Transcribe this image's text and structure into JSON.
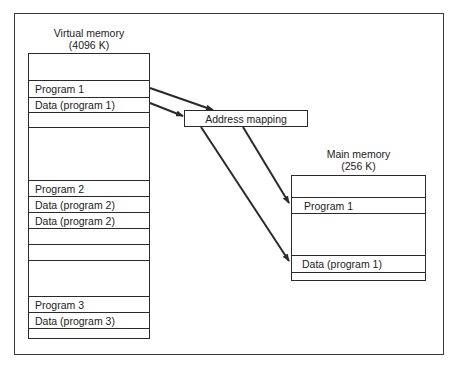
{
  "virtual_memory": {
    "title": "Virtual memory",
    "size": "(4096 K)",
    "rows": [
      {
        "label": "",
        "top": 0,
        "height": 26
      },
      {
        "label": "Program 1",
        "top": 26,
        "height": 17
      },
      {
        "label": "Data (program 1)",
        "top": 43,
        "height": 15
      },
      {
        "label": "",
        "top": 58,
        "height": 15
      },
      {
        "label": "",
        "top": 73,
        "height": 53
      },
      {
        "label": "Program 2",
        "top": 126,
        "height": 16
      },
      {
        "label": "Data (program 2)",
        "top": 142,
        "height": 16
      },
      {
        "label": "Data (program 2)",
        "top": 158,
        "height": 16
      },
      {
        "label": "",
        "top": 174,
        "height": 16
      },
      {
        "label": "",
        "top": 190,
        "height": 16
      },
      {
        "label": "",
        "top": 206,
        "height": 36
      },
      {
        "label": "Program 3",
        "top": 242,
        "height": 16
      },
      {
        "label": "Data (program 3)",
        "top": 258,
        "height": 16
      },
      {
        "label": "",
        "top": 274,
        "height": 11
      }
    ]
  },
  "address_mapping": {
    "label": "Address mapping"
  },
  "main_memory": {
    "title": "Main memory",
    "size": "(256 K)",
    "rows": [
      {
        "label": "",
        "top": 0,
        "height": 21
      },
      {
        "label": "Program 1",
        "top": 21,
        "height": 16
      },
      {
        "label": "",
        "top": 37,
        "height": 42
      },
      {
        "label": "Data (program 1)",
        "top": 79,
        "height": 17
      },
      {
        "label": "",
        "top": 96,
        "height": 9
      }
    ]
  },
  "arrows": [
    {
      "from": "virtual_memory.Program 1",
      "to": "address_mapping"
    },
    {
      "from": "virtual_memory.Data (program 1)",
      "to": "address_mapping"
    },
    {
      "from": "address_mapping",
      "to": "main_memory.Program 1"
    },
    {
      "from": "address_mapping",
      "to": "main_memory.Data (program 1)"
    }
  ]
}
